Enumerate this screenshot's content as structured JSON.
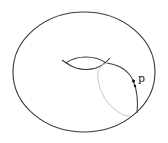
{
  "diagram": {
    "point_label": "p",
    "colors": {
      "outline": "#3a3a3a",
      "meridian_front": "#444444",
      "meridian_back": "#c8c8c8",
      "point": "#111111",
      "background": "#ffffff"
    }
  }
}
